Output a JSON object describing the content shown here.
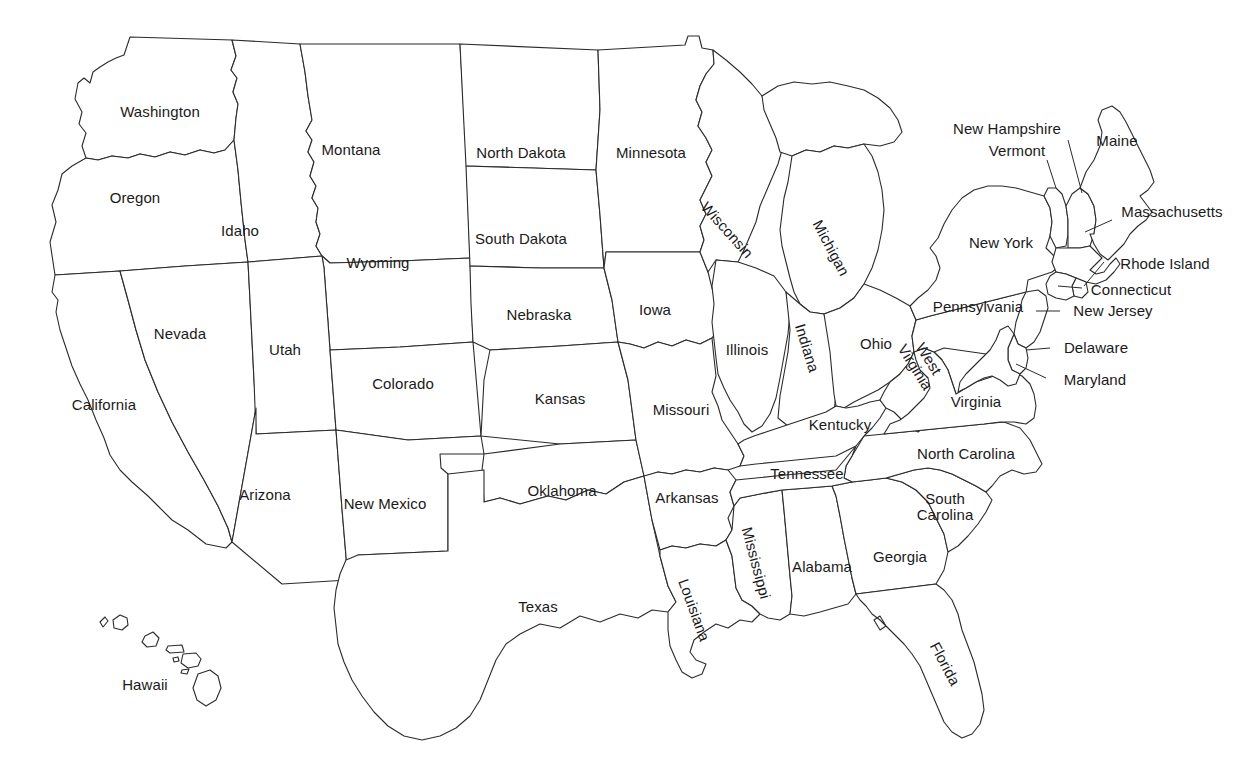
{
  "map": {
    "title": "United States state outline map with state name labels",
    "background_color": "#ffffff",
    "outline_color": "#2b2b2b",
    "label_color": "#1a1a1a",
    "label_font_size_px": 15,
    "width": 1246,
    "height": 781
  },
  "states": [
    {
      "name": "Washington",
      "label": "Washington",
      "x": 160,
      "y": 112,
      "rotate": 0,
      "mode": "inline",
      "leader": null
    },
    {
      "name": "Oregon",
      "label": "Oregon",
      "x": 135,
      "y": 198,
      "rotate": 0,
      "mode": "inline",
      "leader": null
    },
    {
      "name": "Idaho",
      "label": "Idaho",
      "x": 240,
      "y": 231,
      "rotate": 0,
      "mode": "inline",
      "leader": null
    },
    {
      "name": "Montana",
      "label": "Montana",
      "x": 351,
      "y": 150,
      "rotate": 0,
      "mode": "inline",
      "leader": null
    },
    {
      "name": "North Dakota",
      "label": "North Dakota",
      "x": 521,
      "y": 153,
      "rotate": 0,
      "mode": "inline",
      "leader": null
    },
    {
      "name": "Minnesota",
      "label": "Minnesota",
      "x": 651,
      "y": 153,
      "rotate": 0,
      "mode": "inline",
      "leader": null
    },
    {
      "name": "South Dakota",
      "label": "South Dakota",
      "x": 521,
      "y": 239,
      "rotate": 0,
      "mode": "inline",
      "leader": null
    },
    {
      "name": "Wyoming",
      "label": "Wyoming",
      "x": 378,
      "y": 263,
      "rotate": 0,
      "mode": "inline",
      "leader": null
    },
    {
      "name": "Nebraska",
      "label": "Nebraska",
      "x": 539,
      "y": 315,
      "rotate": 0,
      "mode": "inline",
      "leader": null
    },
    {
      "name": "Iowa",
      "label": "Iowa",
      "x": 655,
      "y": 310,
      "rotate": 0,
      "mode": "inline",
      "leader": null
    },
    {
      "name": "Wisconsin",
      "label": "Wisconsin",
      "x": 727,
      "y": 230,
      "rotate": 48,
      "mode": "inline",
      "leader": null
    },
    {
      "name": "Michigan",
      "label": "Michigan",
      "x": 831,
      "y": 248,
      "rotate": 62,
      "mode": "inline",
      "leader": null
    },
    {
      "name": "Nevada",
      "label": "Nevada",
      "x": 180,
      "y": 334,
      "rotate": 0,
      "mode": "inline",
      "leader": null
    },
    {
      "name": "Utah",
      "label": "Utah",
      "x": 285,
      "y": 350,
      "rotate": 0,
      "mode": "inline",
      "leader": null
    },
    {
      "name": "Colorado",
      "label": "Colorado",
      "x": 403,
      "y": 384,
      "rotate": 0,
      "mode": "inline",
      "leader": null
    },
    {
      "name": "Kansas",
      "label": "Kansas",
      "x": 560,
      "y": 399,
      "rotate": 0,
      "mode": "inline",
      "leader": null
    },
    {
      "name": "Missouri",
      "label": "Missouri",
      "x": 681,
      "y": 410,
      "rotate": 0,
      "mode": "inline",
      "leader": null
    },
    {
      "name": "Illinois",
      "label": "Illinois",
      "x": 747,
      "y": 350,
      "rotate": 0,
      "mode": "inline",
      "leader": null
    },
    {
      "name": "Indiana",
      "label": "Indiana",
      "x": 807,
      "y": 348,
      "rotate": 73,
      "mode": "inline",
      "leader": null
    },
    {
      "name": "Ohio",
      "label": "Ohio",
      "x": 876,
      "y": 344,
      "rotate": 0,
      "mode": "inline",
      "leader": null
    },
    {
      "name": "Pennsylvania",
      "label": "Pennsylvania",
      "x": 978,
      "y": 307,
      "rotate": 0,
      "mode": "inline",
      "leader": null
    },
    {
      "name": "New York",
      "label": "New York",
      "x": 1001,
      "y": 243,
      "rotate": 0,
      "mode": "inline",
      "leader": null
    },
    {
      "name": "West Virginia",
      "label": "West\nVirginia",
      "x": 922,
      "y": 363,
      "rotate": 58,
      "mode": "twoline",
      "leader": null
    },
    {
      "name": "Virginia",
      "label": "Virginia",
      "x": 976,
      "y": 402,
      "rotate": 0,
      "mode": "inline",
      "leader": null
    },
    {
      "name": "Kentucky",
      "label": "Kentucky",
      "x": 840,
      "y": 425,
      "rotate": 0,
      "mode": "inline",
      "leader": null
    },
    {
      "name": "Tennessee",
      "label": "Tennessee",
      "x": 807,
      "y": 474,
      "rotate": 0,
      "mode": "inline",
      "leader": null
    },
    {
      "name": "North Carolina",
      "label": "North Carolina",
      "x": 966,
      "y": 454,
      "rotate": 0,
      "mode": "inline",
      "leader": null
    },
    {
      "name": "South Carolina",
      "label": "South\nCarolina",
      "x": 945,
      "y": 507,
      "rotate": 0,
      "mode": "twoline",
      "leader": null
    },
    {
      "name": "Georgia",
      "label": "Georgia",
      "x": 900,
      "y": 557,
      "rotate": 0,
      "mode": "inline",
      "leader": null
    },
    {
      "name": "Alabama",
      "label": "Alabama",
      "x": 822,
      "y": 567,
      "rotate": 0,
      "mode": "inline",
      "leader": null
    },
    {
      "name": "Mississippi",
      "label": "Mississippi",
      "x": 756,
      "y": 563,
      "rotate": 75,
      "mode": "inline",
      "leader": null
    },
    {
      "name": "Louisiana",
      "label": "Louisiana",
      "x": 694,
      "y": 610,
      "rotate": 70,
      "mode": "inline",
      "leader": null
    },
    {
      "name": "Arkansas",
      "label": "Arkansas",
      "x": 687,
      "y": 498,
      "rotate": 0,
      "mode": "inline",
      "leader": null
    },
    {
      "name": "Oklahoma",
      "label": "Oklahoma",
      "x": 562,
      "y": 491,
      "rotate": 0,
      "mode": "inline",
      "leader": null
    },
    {
      "name": "Texas",
      "label": "Texas",
      "x": 538,
      "y": 607,
      "rotate": 0,
      "mode": "inline",
      "leader": null
    },
    {
      "name": "New Mexico",
      "label": "New Mexico",
      "x": 385,
      "y": 504,
      "rotate": 0,
      "mode": "inline",
      "leader": null
    },
    {
      "name": "Arizona",
      "label": "Arizona",
      "x": 265,
      "y": 495,
      "rotate": 0,
      "mode": "inline",
      "leader": null
    },
    {
      "name": "California",
      "label": "California",
      "x": 104,
      "y": 405,
      "rotate": 0,
      "mode": "inline",
      "leader": null
    },
    {
      "name": "Florida",
      "label": "Florida",
      "x": 945,
      "y": 664,
      "rotate": 62,
      "mode": "inline",
      "leader": null
    },
    {
      "name": "Hawaii",
      "label": "Hawaii",
      "x": 145,
      "y": 685,
      "rotate": 0,
      "mode": "inline",
      "leader": null
    },
    {
      "name": "Maine",
      "label": "Maine",
      "x": 1117,
      "y": 141,
      "rotate": 0,
      "mode": "inline",
      "leader": null
    },
    {
      "name": "New Hampshire",
      "label": "New Hampshire",
      "x": 1007,
      "y": 129,
      "rotate": 0,
      "mode": "inline",
      "leader": {
        "x1": 1068,
        "y1": 140,
        "x2": 1082,
        "y2": 193
      }
    },
    {
      "name": "Vermont",
      "label": "Vermont",
      "x": 1017,
      "y": 151,
      "rotate": 0,
      "mode": "inline",
      "leader": {
        "x1": 1047,
        "y1": 160,
        "x2": 1056,
        "y2": 188
      }
    },
    {
      "name": "Massachusetts",
      "label": "Massachusetts",
      "x": 1172,
      "y": 212,
      "rotate": 0,
      "mode": "inline",
      "leader": {
        "x1": 1112,
        "y1": 220,
        "x2": 1088,
        "y2": 230
      }
    },
    {
      "name": "Rhode Island",
      "label": "Rhode Island",
      "x": 1165,
      "y": 264,
      "rotate": 0,
      "mode": "inline",
      "leader": {
        "x1": 1104,
        "y1": 262,
        "x2": 1082,
        "y2": 248
      }
    },
    {
      "name": "Connecticut",
      "label": "Connecticut",
      "x": 1131,
      "y": 290,
      "rotate": 0,
      "mode": "inline",
      "leader": {
        "x1": 1082,
        "y1": 288,
        "x2": 1062,
        "y2": 264
      }
    },
    {
      "name": "New Jersey",
      "label": "New Jersey",
      "x": 1113,
      "y": 311,
      "rotate": 0,
      "mode": "inline",
      "leader": {
        "x1": 1060,
        "y1": 311,
        "x2": 1039,
        "y2": 311
      }
    },
    {
      "name": "Delaware",
      "label": "Delaware",
      "x": 1096,
      "y": 348,
      "rotate": 0,
      "mode": "inline",
      "leader": {
        "x1": 1050,
        "y1": 348,
        "x2": 1029,
        "y2": 348
      }
    },
    {
      "name": "Maryland",
      "label": "Maryland",
      "x": 1095,
      "y": 380,
      "rotate": 0,
      "mode": "inline",
      "leader": {
        "x1": 1046,
        "y1": 378,
        "x2": 1019,
        "y2": 366
      }
    }
  ]
}
